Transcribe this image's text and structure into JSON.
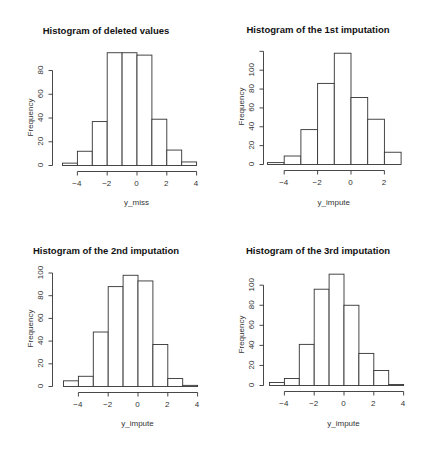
{
  "figure": {
    "background": "#ffffff",
    "bar_fill": "#ffffff",
    "bar_stroke": "#333333",
    "axis_color": "#333333"
  },
  "chart_data": [
    {
      "type": "bar",
      "title": "Histogram of deleted values",
      "xlabel": "y_miss",
      "ylabel": "Frequency",
      "bin_edges": [
        -5,
        -4,
        -3,
        -2,
        -1,
        0,
        1,
        2,
        3,
        4
      ],
      "values": [
        2,
        12,
        37,
        95,
        95,
        93,
        39,
        13,
        3
      ],
      "xticks": [
        -4,
        -2,
        0,
        2,
        4
      ],
      "yticks": [
        0,
        20,
        40,
        60,
        80
      ],
      "xlim": [
        -5,
        4
      ],
      "ylim": [
        0,
        95
      ],
      "grid": false
    },
    {
      "type": "bar",
      "title": "Histogram of the 1st imputation",
      "xlabel": "y_impute",
      "ylabel": "Frequency",
      "bin_edges": [
        -5,
        -4,
        -3,
        -2,
        -1,
        0,
        1,
        2,
        3
      ],
      "values": [
        2,
        9,
        37,
        86,
        118,
        71,
        48,
        13
      ],
      "xticks": [
        -4,
        -2,
        0,
        2
      ],
      "yticks": [
        0,
        20,
        40,
        60,
        80,
        100,
        120
      ],
      "ytick_labels": [
        "0",
        "20",
        "40",
        "60",
        "80",
        "100",
        ""
      ],
      "xlim": [
        -5,
        3
      ],
      "ylim": [
        0,
        120
      ],
      "grid": false
    },
    {
      "type": "bar",
      "title": "Histogram of the 2nd imputation",
      "xlabel": "y_impute",
      "ylabel": "Frequency",
      "bin_edges": [
        -5,
        -4,
        -3,
        -2,
        -1,
        0,
        1,
        2,
        3,
        4
      ],
      "values": [
        5,
        9,
        48,
        88,
        98,
        93,
        37,
        7,
        1
      ],
      "xticks": [
        -4,
        -2,
        0,
        2,
        4
      ],
      "yticks": [
        0,
        20,
        40,
        60,
        80,
        100
      ],
      "xlim": [
        -5,
        4
      ],
      "ylim": [
        0,
        100
      ],
      "grid": false
    },
    {
      "type": "bar",
      "title": "Histogram of the 3rd imputation",
      "xlabel": "y_impute",
      "ylabel": "Frequency",
      "bin_edges": [
        -5,
        -4,
        -3,
        -2,
        -1,
        0,
        1,
        2,
        3,
        4
      ],
      "values": [
        3,
        7,
        41,
        96,
        111,
        80,
        32,
        15,
        1
      ],
      "xticks": [
        -4,
        -2,
        0,
        2,
        4
      ],
      "yticks": [
        0,
        20,
        40,
        60,
        80,
        100
      ],
      "xlim": [
        -5,
        4
      ],
      "ylim": [
        0,
        111
      ],
      "grid": false
    }
  ],
  "layout": [
    {
      "left": 0,
      "top": 0,
      "x0px": 62,
      "xpx_per_unit": 14.9,
      "base": 165,
      "ypx_per_unit": 1.187,
      "yaxis_x": 52,
      "xaxis_y": 171,
      "title_y": 25,
      "xlab_y": 198
    },
    {
      "left": 212,
      "top": 0,
      "x0px": 55,
      "xpx_per_unit": 16.7,
      "base": 164,
      "ypx_per_unit": 0.943,
      "yaxis_x": 51,
      "xaxis_y": 170,
      "title_y": 24,
      "xlab_y": 198
    },
    {
      "left": 0,
      "top": 225,
      "x0px": 63,
      "xpx_per_unit": 14.9,
      "base": 161,
      "ypx_per_unit": 1.135,
      "yaxis_x": 52,
      "xaxis_y": 167,
      "title_y": 20,
      "xlab_y": 194
    },
    {
      "left": 212,
      "top": 225,
      "x0px": 57,
      "xpx_per_unit": 14.9,
      "base": 160,
      "ypx_per_unit": 1.003,
      "yaxis_x": 51,
      "xaxis_y": 166,
      "title_y": 20,
      "xlab_y": 194
    }
  ]
}
